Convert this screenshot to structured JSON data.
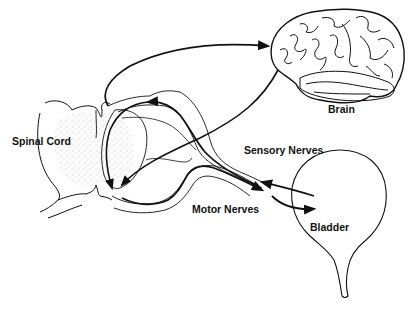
{
  "diagram": {
    "type": "anatomical-pathway",
    "labels": {
      "spinal_cord": "Spinal Cord",
      "brain": "Brain",
      "sensory_nerves": "Sensory Nerves",
      "motor_nerves": "Motor Nerves",
      "bladder": "Bladder"
    },
    "nodes": [
      {
        "id": "spinal-cord",
        "label": "Spinal Cord"
      },
      {
        "id": "brain",
        "label": "Brain"
      },
      {
        "id": "bladder",
        "label": "Bladder"
      }
    ],
    "edges": [
      {
        "from": "spinal-cord",
        "to": "brain",
        "kind": "ascending"
      },
      {
        "from": "brain",
        "to": "spinal-cord",
        "kind": "descending"
      },
      {
        "from": "bladder",
        "to": "spinal-cord",
        "kind": "sensory",
        "label": "Sensory Nerves"
      },
      {
        "from": "spinal-cord",
        "to": "bladder",
        "kind": "motor",
        "label": "Motor Nerves"
      }
    ],
    "colors": {
      "ink": "#111111",
      "background": "#ffffff",
      "stipple": "#888888"
    }
  }
}
